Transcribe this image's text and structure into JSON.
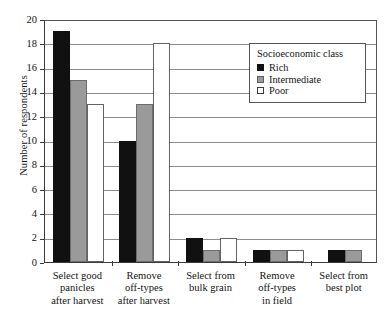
{
  "chart_data": {
    "type": "bar",
    "title": "",
    "xlabel": "",
    "ylabel": "Number of respondents",
    "ylim": [
      0,
      20
    ],
    "yticks": [
      0,
      2,
      4,
      6,
      8,
      10,
      12,
      14,
      16,
      18,
      20
    ],
    "grid": true,
    "legend_position": "upper right",
    "legend_title": "Socioeconomic class",
    "categories": [
      "Select good panicles after harvest",
      "Remove off-types after harvest",
      "Select from bulk grain",
      "Remove off-types in field",
      "Select from best plot"
    ],
    "category_lines": [
      [
        "Select good",
        "panicles",
        "after harvest"
      ],
      [
        "Remove",
        "off-types",
        "after harvest"
      ],
      [
        "Select from",
        "bulk grain"
      ],
      [
        "Remove",
        "off-types",
        "in field"
      ],
      [
        "Select from",
        "best plot"
      ]
    ],
    "series": [
      {
        "name": "Rich",
        "color": "#111111",
        "values": [
          19,
          10,
          2,
          1,
          1
        ]
      },
      {
        "name": "Intermediate",
        "color": "#9a9a9a",
        "values": [
          15,
          13,
          1,
          1,
          1
        ]
      },
      {
        "name": "Poor",
        "color": "#ffffff",
        "values": [
          13,
          18,
          2,
          1,
          0
        ]
      }
    ]
  },
  "legend": {
    "title": "Socioeconomic class",
    "items": [
      {
        "label": "Rich",
        "swatch": "rich"
      },
      {
        "label": "Intermediate",
        "swatch": "inter"
      },
      {
        "label": "Poor",
        "swatch": "poor"
      }
    ]
  },
  "axis": {
    "y_label": "Number of respondents",
    "y_ticks": [
      "0",
      "2",
      "4",
      "6",
      "8",
      "10",
      "12",
      "14",
      "16",
      "18",
      "20"
    ]
  }
}
